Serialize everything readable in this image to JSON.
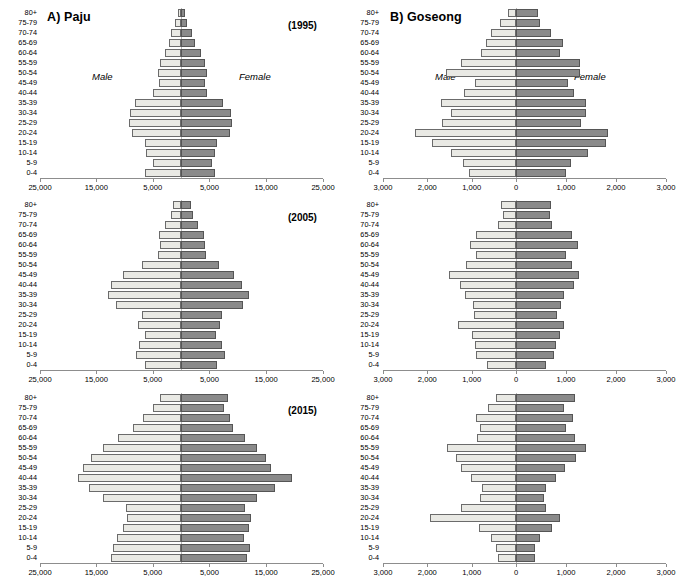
{
  "figure": {
    "panels": [
      {
        "key": "paju",
        "letter_title": "A) Paju",
        "male_label": "Male",
        "female_label": "Female"
      },
      {
        "key": "goseong",
        "letter_title": "B) Goseong",
        "male_label": "Male",
        "female_label": "Female"
      }
    ],
    "years": [
      "(1995)",
      "(2005)",
      "(2015)"
    ],
    "colors": {
      "male_fill": "#e9e9e4",
      "male_stroke": "#6b6b6b",
      "female_fill": "#8a8a8a",
      "female_stroke": "#555555",
      "axis": "#8d8d8d",
      "zero": "#b8b8b8"
    }
  },
  "chart_data": [
    {
      "type": "bar",
      "subtype": "population-pyramid",
      "title": "A) Paju",
      "annotation": "(1995)",
      "xlabel": "",
      "ylabel": "",
      "grid": false,
      "legend_position": "inline-italic-labels",
      "categories": [
        "0-4",
        "5-9",
        "10-14",
        "15-19",
        "20-24",
        "25-29",
        "30-34",
        "35-39",
        "40-44",
        "45-49",
        "50-54",
        "55-59",
        "60-64",
        "65-69",
        "70-74",
        "75-79",
        "80+"
      ],
      "xlim": [
        -25000,
        25000
      ],
      "xticks": [
        -25000,
        -15000,
        -5000,
        5000,
        15000,
        25000
      ],
      "xticklabels": [
        "25,000",
        "15,000",
        "5,000",
        "5,000",
        "15,000",
        "25,000"
      ],
      "series": [
        {
          "name": "Male",
          "values": [
            6400,
            4900,
            6200,
            6400,
            8700,
            9200,
            9000,
            8200,
            4900,
            3900,
            4000,
            3700,
            2900,
            2200,
            1700,
            1000,
            600
          ]
        },
        {
          "name": "Female",
          "values": [
            5900,
            5400,
            6000,
            6400,
            8600,
            8900,
            8800,
            7400,
            4500,
            4300,
            4500,
            4200,
            3500,
            2400,
            1900,
            1000,
            700
          ]
        }
      ]
    },
    {
      "type": "bar",
      "subtype": "population-pyramid",
      "title": "B) Goseong",
      "annotation": "(1995)",
      "xlabel": "",
      "ylabel": "",
      "grid": false,
      "legend_position": "inline-italic-labels",
      "categories": [
        "0-4",
        "5-9",
        "10-14",
        "15-19",
        "20-24",
        "25-29",
        "30-34",
        "35-39",
        "40-44",
        "45-49",
        "50-54",
        "55-59",
        "60-64",
        "65-69",
        "70-74",
        "75-79",
        "80+"
      ],
      "xlim": [
        -3000,
        3000
      ],
      "xticks": [
        -3000,
        -2000,
        -1000,
        0,
        1000,
        2000,
        3000
      ],
      "xticklabels": [
        "3,000",
        "2,000",
        "1,000",
        "0",
        "1,000",
        "2,000",
        "3,000"
      ],
      "series": [
        {
          "name": "Male",
          "values": [
            1070,
            1190,
            1470,
            1900,
            2270,
            1680,
            1460,
            1700,
            1180,
            920,
            1590,
            1230,
            790,
            670,
            560,
            370,
            190
          ]
        },
        {
          "name": "Female",
          "values": [
            1000,
            1100,
            1430,
            1790,
            1840,
            1300,
            1390,
            1390,
            1150,
            1030,
            1280,
            1270,
            880,
            930,
            690,
            480,
            430
          ]
        }
      ]
    },
    {
      "type": "bar",
      "subtype": "population-pyramid",
      "title": "A) Paju",
      "annotation": "(2005)",
      "xlabel": "",
      "ylabel": "",
      "grid": false,
      "legend_position": "inline-italic-labels",
      "categories": [
        "0-4",
        "5-9",
        "10-14",
        "15-19",
        "20-24",
        "25-29",
        "30-34",
        "35-39",
        "40-44",
        "45-49",
        "50-54",
        "55-59",
        "60-64",
        "65-69",
        "70-74",
        "75-79",
        "80+"
      ],
      "xlim": [
        -25000,
        25000
      ],
      "xticks": [
        -25000,
        -15000,
        -5000,
        5000,
        15000,
        25000
      ],
      "xticklabels": [
        "25,000",
        "15,000",
        "5,000",
        "5,000",
        "15,000",
        "25,000"
      ],
      "series": [
        {
          "name": "Male",
          "values": [
            6300,
            7900,
            7400,
            6300,
            7700,
            7000,
            11500,
            13000,
            12500,
            10300,
            6900,
            4000,
            3800,
            3900,
            2900,
            1700,
            1500
          ]
        },
        {
          "name": "Female",
          "values": [
            6300,
            7800,
            7200,
            6200,
            6900,
            7300,
            11000,
            11900,
            10700,
            9400,
            6700,
            4400,
            4300,
            4000,
            3000,
            2100,
            1800
          ]
        }
      ]
    },
    {
      "type": "bar",
      "subtype": "population-pyramid",
      "title": "B) Goseong",
      "annotation": "(2005)",
      "xlabel": "",
      "ylabel": "",
      "grid": false,
      "legend_position": "inline-italic-labels",
      "categories": [
        "0-4",
        "5-9",
        "10-14",
        "15-19",
        "20-24",
        "25-29",
        "30-34",
        "35-39",
        "40-44",
        "45-49",
        "50-54",
        "55-59",
        "60-64",
        "65-69",
        "70-74",
        "75-79",
        "80+"
      ],
      "xlim": [
        -3000,
        3000
      ],
      "xticks": [
        -3000,
        -2000,
        -1000,
        0,
        1000,
        2000,
        3000
      ],
      "xticklabels": [
        "3,000",
        "2,000",
        "1,000",
        "0",
        "1,000",
        "2,000",
        "3,000"
      ],
      "series": [
        {
          "name": "Male",
          "values": [
            660,
            900,
            920,
            1000,
            1310,
            950,
            960,
            1160,
            1270,
            1520,
            1120,
            900,
            1040,
            900,
            400,
            300,
            330
          ]
        },
        {
          "name": "Female",
          "values": [
            600,
            760,
            800,
            880,
            960,
            820,
            890,
            950,
            1150,
            1250,
            1110,
            990,
            1240,
            1110,
            720,
            670,
            690
          ]
        }
      ]
    },
    {
      "type": "bar",
      "subtype": "population-pyramid",
      "title": "A) Paju",
      "annotation": "(2015)",
      "xlabel": "",
      "ylabel": "",
      "grid": false,
      "legend_position": "inline-italic-labels",
      "categories": [
        "0-4",
        "5-9",
        "10-14",
        "15-19",
        "20-24",
        "25-29",
        "30-34",
        "35-39",
        "40-44",
        "45-49",
        "50-54",
        "55-59",
        "60-64",
        "65-69",
        "70-74",
        "75-79",
        "80+"
      ],
      "xlim": [
        -25000,
        25000
      ],
      "xticks": [
        -25000,
        -15000,
        -5000,
        5000,
        15000,
        25000
      ],
      "xticklabels": [
        "25,000",
        "15,000",
        "5,000",
        "5,000",
        "15,000",
        "25,000"
      ],
      "series": [
        {
          "name": "Male",
          "values": [
            12400,
            12000,
            11300,
            10300,
            9500,
            9700,
            13900,
            16400,
            18200,
            17400,
            15900,
            13900,
            11200,
            8500,
            6800,
            5000,
            3800
          ]
        },
        {
          "name": "Female",
          "values": [
            11600,
            12100,
            11100,
            11900,
            12400,
            11300,
            13300,
            16500,
            19500,
            15800,
            14900,
            13400,
            11200,
            9100,
            8600,
            7600,
            8300
          ]
        }
      ]
    },
    {
      "type": "bar",
      "subtype": "population-pyramid",
      "title": "B) Goseong",
      "annotation": "(2015)",
      "xlabel": "",
      "ylabel": "",
      "grid": false,
      "legend_position": "inline-italic-labels",
      "categories": [
        "0-4",
        "5-9",
        "10-14",
        "15-19",
        "20-24",
        "25-29",
        "30-34",
        "35-39",
        "40-44",
        "45-49",
        "50-54",
        "55-59",
        "60-64",
        "65-69",
        "70-74",
        "75-79",
        "80+"
      ],
      "xlim": [
        -3000,
        3000
      ],
      "xticks": [
        -3000,
        -2000,
        -1000,
        0,
        1000,
        2000,
        3000
      ],
      "xticklabels": [
        "3,000",
        "2,000",
        "1,000",
        "0",
        "1,000",
        "2,000",
        "3,000"
      ],
      "series": [
        {
          "name": "Male",
          "values": [
            410,
            450,
            570,
            840,
            1930,
            1240,
            820,
            760,
            1010,
            1230,
            1360,
            1550,
            880,
            820,
            900,
            640,
            460
          ]
        },
        {
          "name": "Female",
          "values": [
            380,
            380,
            480,
            710,
            870,
            590,
            560,
            600,
            800,
            970,
            1200,
            1390,
            1170,
            990,
            1140,
            960,
            1180
          ]
        }
      ]
    }
  ]
}
